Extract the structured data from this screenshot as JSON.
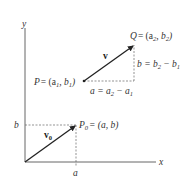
{
  "diagram": {
    "title": "",
    "axes": {
      "x_label": "x",
      "y_label": "y"
    },
    "ticks": {
      "x_tick": "a",
      "y_tick": "b"
    },
    "points": {
      "P0": {
        "name": "P",
        "sub": "0",
        "text": "= (a, b)"
      },
      "P": {
        "name": "P",
        "text_prefix": "= (a",
        "sub1": "1",
        "mid": ", b",
        "sub2": "1",
        "close": ")"
      },
      "Q": {
        "name": "Q",
        "text_prefix": "= (a",
        "sub1": "2",
        "mid": ", b",
        "sub2": "2",
        "close": ")"
      }
    },
    "vectors": {
      "v0": {
        "name": "v",
        "sub": "0"
      },
      "v": {
        "name": "v"
      }
    },
    "components": {
      "horizontal": {
        "lhs": "a = a",
        "s1": "2",
        "minus": " − a",
        "s2": "1"
      },
      "vertical": {
        "lhs": "b = b",
        "s1": "2",
        "minus": " − b",
        "s2": "1"
      }
    },
    "colors": {
      "axis": "#555555",
      "vector": "#222222",
      "dashed": "#666666",
      "text": "#333333"
    }
  }
}
